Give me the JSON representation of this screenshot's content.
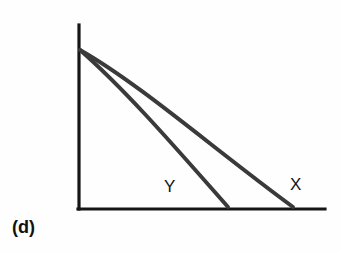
{
  "figure": {
    "panel_label": "(d)",
    "background_color": "#fefefe",
    "axis_color": "#151515"
  },
  "chart_data": {
    "type": "line",
    "title": "",
    "subtitle": "",
    "xlabel": "",
    "ylabel": "",
    "xlim": [
      0,
      100
    ],
    "ylim": [
      0,
      100
    ],
    "grid": false,
    "legend_position": "inline-curve-labels",
    "axes_style": "two-spine-no-ticks",
    "annotations": [
      {
        "text": "(d)",
        "x_px": 12,
        "y_px": 232,
        "bold": true
      },
      {
        "text": "Y",
        "x_px": 164,
        "y_px": 192,
        "bold": false
      },
      {
        "text": "X",
        "x_px": 290,
        "y_px": 190,
        "bold": false
      }
    ],
    "series": [
      {
        "name": "X",
        "label": "X",
        "color": "#3a3a3a",
        "shape": "convex-decreasing",
        "x": [
          0,
          10,
          20,
          30,
          40,
          50,
          60,
          70,
          80,
          90,
          100
        ],
        "y": [
          100,
          91,
          81,
          71,
          61,
          51,
          41,
          31,
          21,
          11,
          0
        ]
      },
      {
        "name": "Y",
        "label": "Y",
        "color": "#3a3a3a",
        "shape": "convex-decreasing-steeper",
        "x": [
          0,
          7,
          14,
          21,
          28,
          35,
          42,
          49,
          56,
          63,
          70
        ],
        "y": [
          100,
          89,
          78,
          68,
          58,
          48,
          38,
          28,
          19,
          9,
          0
        ]
      }
    ]
  },
  "geometry": {
    "y_axis": {
      "x": 79,
      "y_top": 25,
      "y_bottom": 209
    },
    "x_axis": {
      "y": 209,
      "x_left": 79,
      "x_right": 325
    },
    "origin_point": {
      "x": 79,
      "y": 209
    },
    "curves_start": {
      "x": 80,
      "y": 50
    },
    "curve_x_end": {
      "x": 293,
      "y": 207
    },
    "curve_y_end": {
      "x": 228,
      "y": 207
    }
  }
}
